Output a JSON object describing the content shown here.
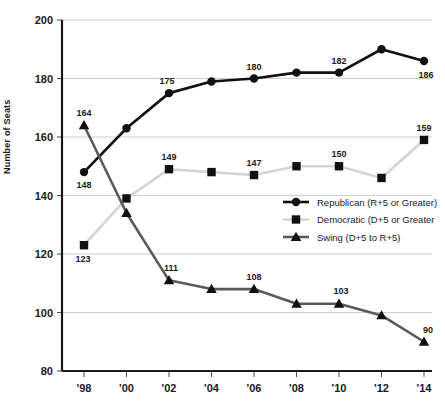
{
  "chart_data": {
    "type": "line",
    "title": "",
    "xlabel": "",
    "ylabel": "Number of Seats",
    "x": [
      "'98",
      "'00",
      "'02",
      "'04",
      "'06",
      "'08",
      "'10",
      "'12",
      "'14"
    ],
    "categories": [
      "'98",
      "'00",
      "'02",
      "'04",
      "'06",
      "'08",
      "'10",
      "'12",
      "'14"
    ],
    "ylim": [
      80,
      200
    ],
    "yticks": [
      80,
      100,
      120,
      140,
      160,
      180,
      200
    ],
    "grid": true,
    "legend_position": "center-right",
    "series": [
      {
        "name": "Republican (R+5 or Greater)",
        "color": "#111111",
        "marker": "circle",
        "values": [
          148,
          163,
          175,
          179,
          180,
          182,
          182,
          190,
          186
        ],
        "point_labels": [
          "148",
          "",
          "175",
          "",
          "180",
          "",
          "182",
          "",
          "186"
        ]
      },
      {
        "name": "Democratic (D+5 or Greater",
        "color": "#d4d4d4",
        "marker": "square",
        "values": [
          123,
          139,
          149,
          148,
          147,
          150,
          150,
          146,
          159
        ],
        "point_labels": [
          "123",
          "",
          "149",
          "",
          "147",
          "",
          "150",
          "",
          "159"
        ]
      },
      {
        "name": "Swing (D+5 to R+5)",
        "color": "#5a5a5a",
        "marker": "triangle",
        "values": [
          164,
          134,
          111,
          108,
          108,
          103,
          103,
          99,
          90
        ],
        "point_labels": [
          "164",
          "",
          "111",
          "",
          "108",
          "",
          "103",
          "",
          "90"
        ]
      }
    ]
  },
  "axis": {
    "y_title": "Number of Seats",
    "y_tick_labels": [
      "200",
      "180",
      "160",
      "140",
      "120",
      "100",
      "80"
    ],
    "x_tick_labels": [
      "'98",
      "'00",
      "'02",
      "'04",
      "'06",
      "'08",
      "'10",
      "'12",
      "'14"
    ]
  },
  "legend": {
    "items": [
      {
        "label": "Republican (R+5 or Greater)",
        "marker": "circle",
        "color": "#111111"
      },
      {
        "label": "Democratic (D+5 or Greater",
        "marker": "square",
        "color": "#d4d4d4"
      },
      {
        "label": "Swing (D+5 to R+5)",
        "marker": "triangle",
        "color": "#5a5a5a"
      }
    ]
  },
  "point_label_offsets": {
    "republican": [
      {
        "dx": 0,
        "dy": 16
      },
      null,
      {
        "dx": -2,
        "dy": -9
      },
      null,
      {
        "dx": 0,
        "dy": -9
      },
      null,
      {
        "dx": 0,
        "dy": -9
      },
      null,
      {
        "dx": 2,
        "dy": 17
      }
    ],
    "democratic": [
      {
        "dx": -1,
        "dy": 17
      },
      null,
      {
        "dx": 0,
        "dy": -9
      },
      null,
      {
        "dx": 0,
        "dy": -9
      },
      null,
      {
        "dx": 0,
        "dy": -9
      },
      null,
      {
        "dx": 0,
        "dy": -9
      }
    ],
    "swing": [
      {
        "dx": 0,
        "dy": -9
      },
      null,
      {
        "dx": 2,
        "dy": -9
      },
      null,
      {
        "dx": 0,
        "dy": -9
      },
      null,
      {
        "dx": 2,
        "dy": -10
      },
      null,
      {
        "dx": 4,
        "dy": -9
      }
    ]
  }
}
